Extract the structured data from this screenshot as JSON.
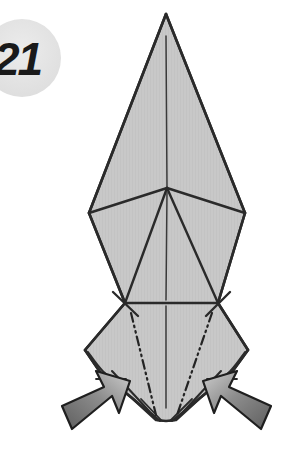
{
  "diagram": {
    "kind": "origami-folding-step",
    "step_number": "21",
    "step_badge_shape": "circle",
    "background_color": "#ffffff",
    "paper_fill_color": "#c8c8c8",
    "paper_fill_shadow_color": "#b6b6b6",
    "outline_color": "#2a2a2a",
    "crease_color": "#2a2a2a",
    "badge_fill_color": "#e4e4e4",
    "arrow_fill_light": "#bdbdbd",
    "arrow_fill_dark": "#5e5e5e",
    "arrow_outline_color": "#1f1f1f",
    "model_description": "Tall pointed origami base with upper spire, central diamond and two lower side flaps",
    "fold_symbol": "dash-dot-dot reverse-fold crease",
    "arrows": [
      {
        "name": "left-fold-arrow",
        "direction": "up-right",
        "meaning": "fold flap inward"
      },
      {
        "name": "right-fold-arrow",
        "direction": "up-left",
        "meaning": "fold flap inward"
      }
    ],
    "geometry": {
      "apex": [
        166,
        14
      ],
      "spire_left": [
        89,
        213
      ],
      "spire_right": [
        245,
        213
      ],
      "center_junction": [
        167,
        188
      ],
      "waist_left": [
        125,
        303
      ],
      "waist_right": [
        218,
        303
      ],
      "flap_left_tip": [
        85,
        350
      ],
      "flap_right_tip": [
        248,
        350
      ],
      "bottom_point": [
        166,
        420
      ],
      "center_axis_x": 166
    }
  }
}
